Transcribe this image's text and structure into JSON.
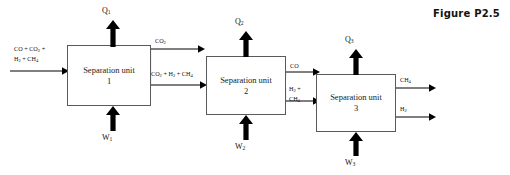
{
  "figure": {
    "caption": "Figure P2.5"
  },
  "units": [
    {
      "id": "separation-unit-1",
      "title": "Separation unit",
      "number": "1",
      "heat_label": "Q",
      "heat_sub": "1",
      "work_label": "W",
      "work_sub": "1"
    },
    {
      "id": "separation-unit-2",
      "title": "Separation unit",
      "number": "2",
      "heat_label": "Q",
      "heat_sub": "2",
      "work_label": "W",
      "work_sub": "2"
    },
    {
      "id": "separation-unit-3",
      "title": "Separation unit",
      "number": "3",
      "heat_label": "Q",
      "heat_sub": "3",
      "work_label": "W",
      "work_sub": "3"
    }
  ],
  "streams": {
    "feed": {
      "line1_a": "CO + CO",
      "line1_sub": "2",
      "line1_b": " +",
      "line2_a": "H",
      "line2_sub1": "2",
      "line2_b": " + CH",
      "line2_sub2": "4"
    },
    "unit1_top_out": {
      "text": "CO",
      "sub": "2"
    },
    "unit1_bottom_out": {
      "a": "CO",
      "sub1": "2",
      "b": " + H",
      "sub2": "2",
      "c": " + CH",
      "sub3": "4"
    },
    "unit2_top_out": {
      "text": "CO"
    },
    "unit2_bottom_out": {
      "line1_a": "H",
      "line1_sub": "2",
      "line1_b": " +",
      "line2_a": "CH",
      "line2_sub": "4"
    },
    "unit3_top_out": {
      "text": "CH",
      "sub": "4"
    },
    "unit3_bottom_out": {
      "text": "H",
      "sub": "2"
    }
  },
  "colors": {
    "box_border": "#5a5a5a",
    "arrow": "#000000",
    "text": "#111111",
    "background": "#ffffff"
  }
}
